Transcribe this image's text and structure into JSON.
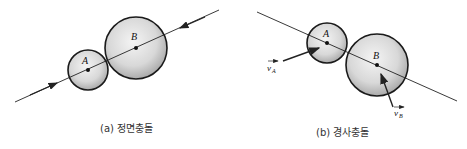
{
  "panels": [
    {
      "id": "a",
      "caption": "(a) 정면충돌",
      "labels": {
        "A": "A",
        "B": "B"
      }
    },
    {
      "id": "b",
      "caption": "(b) 경사충돌",
      "labels": {
        "A": "A",
        "B": "B",
        "vA": "v",
        "vA_sub": "A",
        "vB": "v",
        "vB_sub": "B"
      }
    }
  ],
  "colors": {
    "line": "#222222",
    "sphere_edge": "#1a1a1a",
    "sphere_light": "#f2f2f2",
    "sphere_dark": "#a8a8a8"
  }
}
